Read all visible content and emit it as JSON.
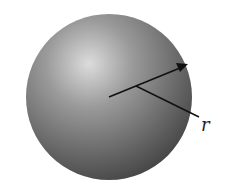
{
  "diagram": {
    "title": "",
    "shape": "sphere",
    "radius_label": "r",
    "colors": {
      "sphere_light": "#d6d6d6",
      "sphere_dark": "#4a4a4a",
      "arrow": "#111111",
      "background": "#ffffff"
    }
  }
}
